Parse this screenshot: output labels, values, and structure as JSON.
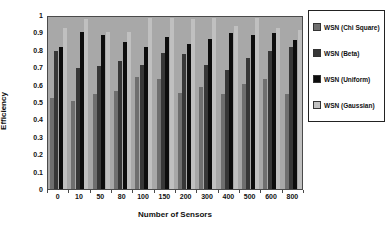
{
  "chart_data": {
    "type": "bar",
    "title": "",
    "xlabel": "Number of Sensors",
    "ylabel": "Efficiency",
    "ylim": [
      0,
      1
    ],
    "yticklabels": [
      "0",
      "0.1",
      "0.2",
      "0.3",
      "0.4",
      "0.5",
      "0.6",
      "0.7",
      "0.8",
      "0.9",
      "1"
    ],
    "categories": [
      "0",
      "10",
      "50",
      "80",
      "100",
      "150",
      "200",
      "300",
      "400",
      "500",
      "600",
      "800"
    ],
    "series": [
      {
        "name": "WSN (Chi Square)",
        "color": "#6f6f6f",
        "values": [
          0.53,
          0.51,
          0.55,
          0.57,
          0.65,
          0.64,
          0.56,
          0.59,
          0.55,
          0.61,
          0.64,
          0.55
        ]
      },
      {
        "name": "WSN (Beta)",
        "color": "#373737",
        "values": [
          0.8,
          0.7,
          0.71,
          0.74,
          0.72,
          0.79,
          0.78,
          0.72,
          0.69,
          0.76,
          0.8,
          0.82
        ]
      },
      {
        "name": "WSN (Uniform)",
        "color": "#0d0d0d",
        "values": [
          0.82,
          0.91,
          0.89,
          0.85,
          0.82,
          0.88,
          0.84,
          0.87,
          0.9,
          0.89,
          0.9,
          0.86
        ]
      },
      {
        "name": "WSN (Gaussian)",
        "color": "#c0c0c0",
        "values": [
          0.93,
          0.98,
          0.91,
          0.91,
          0.99,
          0.99,
          0.98,
          0.99,
          0.94,
          0.99,
          0.93,
          0.92
        ]
      }
    ],
    "legend_position": "right",
    "grid": false,
    "plot_bg": "#a8a8a8",
    "axis_color": "#4a4a4a"
  }
}
